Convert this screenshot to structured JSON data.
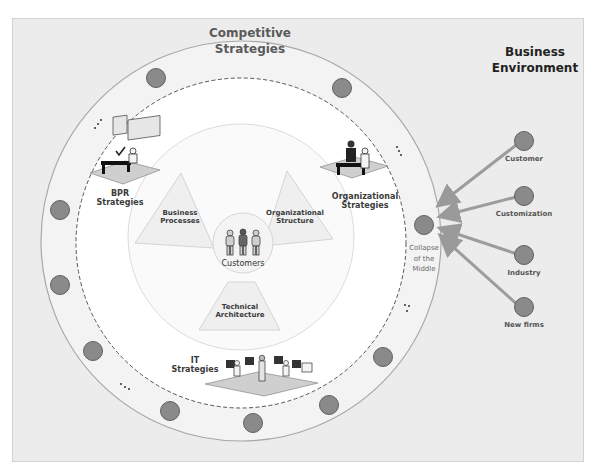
{
  "diagram": {
    "outer_ring_title": [
      "Competitive",
      "Strategies"
    ],
    "environment_title": [
      "Business",
      "Environment"
    ],
    "center": {
      "label": "Customers"
    },
    "inner_segments": [
      {
        "id": "business-processes",
        "lines": [
          "Business",
          "Processes"
        ]
      },
      {
        "id": "organizational-structure",
        "lines": [
          "Organizational",
          "Structure"
        ]
      },
      {
        "id": "technical-architecture",
        "lines": [
          "Technical",
          "Architecture"
        ]
      }
    ],
    "strategies": [
      {
        "id": "bpr",
        "lines": [
          "BPR",
          "Strategies"
        ]
      },
      {
        "id": "organizational",
        "lines": [
          "Organizational",
          "Strategies"
        ]
      },
      {
        "id": "it",
        "lines": [
          "IT",
          "Strategies"
        ]
      }
    ],
    "collapse_node": {
      "lines": [
        "Collapse",
        "of the",
        "Middle"
      ]
    },
    "environment_forces": [
      {
        "label": "Customer"
      },
      {
        "label": "Customization"
      },
      {
        "label": "Industry"
      },
      {
        "label": "New firms"
      }
    ],
    "ellipsis": "..."
  },
  "colors": {
    "background": "#ececec",
    "ring": "#f2f2f2",
    "inner": "#ffffff",
    "node_fill": "#8a8a8a",
    "node_stroke": "#5e5e5e",
    "arrow": "#9a9a9a",
    "segment": "#ececec"
  }
}
